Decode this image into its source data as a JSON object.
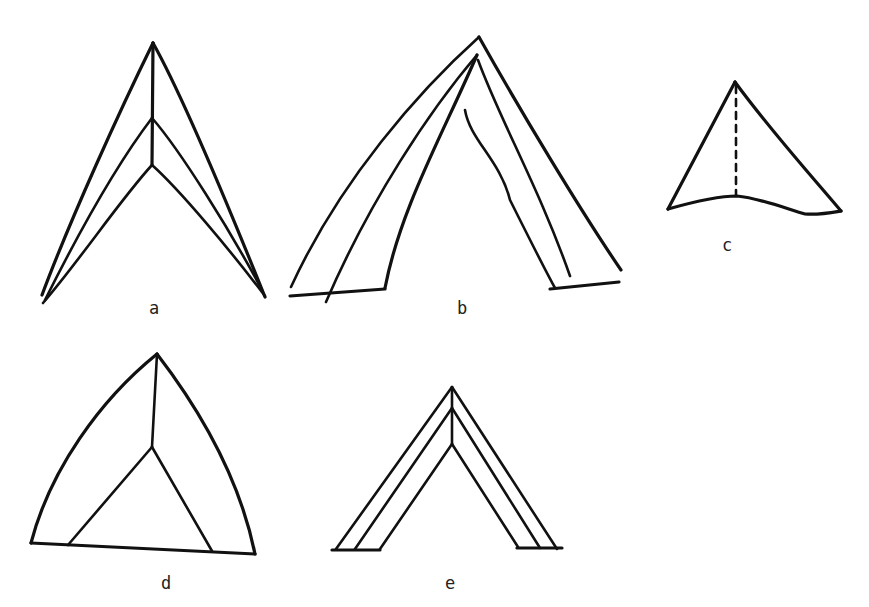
{
  "figure": {
    "stroke_color": "#111111",
    "background": "#ffffff",
    "panels": [
      {
        "id": "a",
        "label": "a",
        "shape": "arrowhead with three nested chevrons meeting a central vertical spine"
      },
      {
        "id": "b",
        "label": "b",
        "shape": "open tent/peak with two outer lines, inner lines and partial base segments"
      },
      {
        "id": "c",
        "label": "c",
        "shape": "triangle with dashed vertical line from apex to base"
      },
      {
        "id": "d",
        "label": "d",
        "shape": "curved-sided triangle with inner triangle joined to apex by vertical line"
      },
      {
        "id": "e",
        "label": "e",
        "shape": "triple nested chevron with central spine and flat feet"
      }
    ]
  }
}
